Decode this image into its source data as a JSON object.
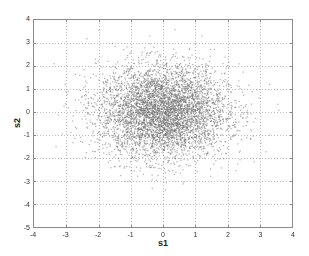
{
  "chart_data": {
    "type": "scatter",
    "title": "",
    "xlabel": "s1",
    "ylabel": "s2",
    "xlim": [
      -4,
      4
    ],
    "ylim": [
      -5,
      4
    ],
    "xticks": [
      "-4",
      "-3",
      "-2",
      "-1",
      "0",
      "1",
      "2",
      "3",
      "4"
    ],
    "yticks": [
      "4",
      "3",
      "2",
      "1",
      "0",
      "-1",
      "-2",
      "-3",
      "-4",
      "-5"
    ],
    "grid": true,
    "grid_style": "dotted",
    "legend": null,
    "series": [
      {
        "name": "samples",
        "distribution": "bivariate standard normal (approx. mean [0,0], std [1,1])",
        "n_points_approx": 5000,
        "marker": "small dot",
        "color": "#6e6e6e",
        "x_range_observed": [
          -3.8,
          3.7
        ],
        "y_range_observed": [
          -4.3,
          3.8
        ]
      }
    ]
  },
  "colors": {
    "axis": "#8a8a8a",
    "grid": "#bdbdbd",
    "points": "#6e6e6e",
    "background": "#ffffff"
  }
}
